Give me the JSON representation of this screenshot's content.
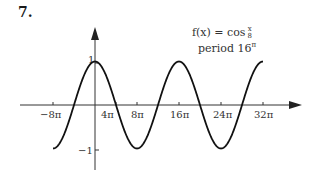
{
  "problem": {
    "number": "7."
  },
  "annotation": {
    "function_prefix": "f(x) = cos",
    "frac_num": "x",
    "frac_den": "8",
    "period_prefix": "period 16",
    "period_suffix": "π"
  },
  "chart_data": {
    "type": "line",
    "xlabel": "",
    "ylabel": "",
    "function": "cos(x/8)",
    "x_ticks": [
      {
        "label": "−8π",
        "value_pi": -8
      },
      {
        "label": "4π",
        "value_pi": 4
      },
      {
        "label": "8π",
        "value_pi": 8
      },
      {
        "label": "16π",
        "value_pi": 16
      },
      {
        "label": "24π",
        "value_pi": 24
      },
      {
        "label": "32π",
        "value_pi": 32
      }
    ],
    "y_ticks": [
      {
        "label": "1",
        "value": 1
      },
      {
        "label": "−1",
        "value": -1
      }
    ],
    "xlim_pi": [
      -8,
      32
    ],
    "ylim": [
      -1,
      1
    ],
    "grid": false,
    "legend": "none",
    "series": [
      {
        "name": "cos(x/8)",
        "x_pi": [
          -8,
          -4,
          0,
          4,
          8,
          12,
          16,
          20,
          24,
          28,
          32
        ],
        "y": [
          -1,
          0,
          1,
          0,
          -1,
          0,
          1,
          0,
          -1,
          0,
          1
        ]
      }
    ],
    "colors": {
      "curve": "#111111",
      "axes": "#333333"
    }
  }
}
